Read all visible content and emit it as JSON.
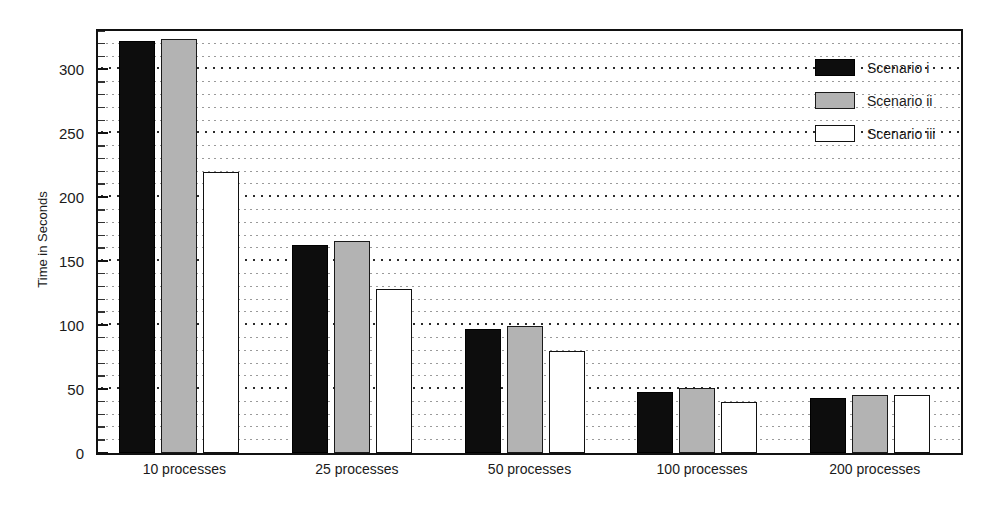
{
  "chart_data": {
    "type": "bar",
    "title": "",
    "subtitle": "",
    "xlabel": "",
    "ylabel": "Time in Seconds",
    "categories": [
      "10 processes",
      "25 processes",
      "50 processes",
      "100 processes",
      "200 processes"
    ],
    "series": [
      {
        "name": "Scenario i",
        "color": "#0d0d0d",
        "values": [
          322,
          163,
          97,
          48,
          43
        ]
      },
      {
        "name": "Scenario ii",
        "color": "#b3b3b3",
        "values": [
          324,
          166,
          99,
          51,
          45
        ]
      },
      {
        "name": "Scenario iii",
        "color": "#ffffff",
        "values": [
          220,
          128,
          80,
          40,
          45
        ]
      }
    ],
    "ylim": [
      0,
      330
    ],
    "ytick_values": [
      0,
      50,
      100,
      150,
      200,
      250,
      300
    ],
    "ytick_labels": [
      "0",
      "50",
      "100",
      "150",
      "200",
      "250",
      "300"
    ],
    "yminor_step": 10,
    "grid": true,
    "grid_style": "dotted-horizontal",
    "legend": {
      "position": "top-right",
      "entries": [
        "Scenario i",
        "Scenario ii",
        "Scenario iii"
      ]
    },
    "frame": true,
    "axis_colors": {
      "frame": "#111111",
      "major_grid": "#2b2b2b",
      "minor_grid": "#9a9a9a",
      "text": "#1a1a1a"
    }
  }
}
